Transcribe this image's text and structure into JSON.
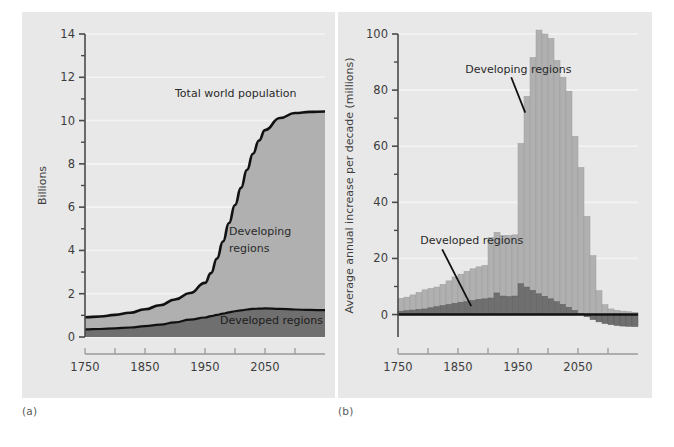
{
  "figure": {
    "background_color": "#ffffff",
    "panel_color": "#e8e8e8",
    "caption_a": "(a)",
    "caption_b": "(b)"
  },
  "colors": {
    "developed": "#6f6f6f",
    "developing": "#b0b0b0",
    "line": "#111111",
    "gridline": "#f4f4f4",
    "axis": "#4a4a4a",
    "text": "#3d3d3d"
  },
  "chart_data": [
    {
      "type": "area",
      "panel": "a",
      "title": "",
      "xlabel": "",
      "ylabel": "Billions",
      "xlim": [
        1750,
        2150
      ],
      "ylim": [
        0,
        14
      ],
      "grid": true,
      "xticks": [
        1750,
        1850,
        1950,
        2050
      ],
      "xtick_labels": [
        "1750",
        "1850",
        "1950",
        "2050"
      ],
      "xminor": [
        1800,
        1900,
        2000,
        2100
      ],
      "yticks": [
        0,
        2,
        4,
        6,
        8,
        10,
        12,
        14
      ],
      "ytick_labels": [
        "0",
        "2",
        "4",
        "6",
        "8",
        "10",
        "12",
        "14"
      ],
      "yminor": [
        1,
        3,
        5,
        7,
        9,
        11,
        13
      ],
      "annotations": [
        {
          "text": "Total world population",
          "x": 1900,
          "y": 11.1
        },
        {
          "text": "Developing",
          "x": 1990,
          "y": 4.7
        },
        {
          "text": "regions",
          "x": 1990,
          "y": 3.95
        },
        {
          "text": "Developed regions",
          "x": 1975,
          "y": 0.62
        }
      ],
      "x": [
        1750,
        1775,
        1800,
        1825,
        1850,
        1875,
        1900,
        1925,
        1950,
        1960,
        1970,
        1980,
        1990,
        2000,
        2010,
        2020,
        2030,
        2040,
        2050,
        2075,
        2100,
        2125,
        2150
      ],
      "series": [
        {
          "name": "Developed regions",
          "values": [
            0.35,
            0.37,
            0.4,
            0.44,
            0.5,
            0.57,
            0.68,
            0.8,
            0.9,
            0.96,
            1.02,
            1.08,
            1.14,
            1.19,
            1.23,
            1.27,
            1.3,
            1.31,
            1.32,
            1.3,
            1.27,
            1.25,
            1.24
          ]
        },
        {
          "name": "Developing regions",
          "values": [
            0.56,
            0.58,
            0.62,
            0.68,
            0.78,
            0.9,
            1.05,
            1.23,
            1.6,
            1.99,
            2.61,
            3.33,
            4.13,
            4.91,
            5.66,
            6.45,
            7.17,
            7.77,
            8.24,
            8.82,
            9.08,
            9.15,
            9.18
          ]
        }
      ],
      "total_label": "Total world population",
      "total": [
        0.91,
        0.95,
        1.02,
        1.12,
        1.28,
        1.47,
        1.73,
        2.03,
        2.5,
        2.95,
        3.63,
        4.41,
        5.27,
        6.1,
        6.89,
        7.72,
        8.47,
        9.08,
        9.56,
        10.12,
        10.35,
        10.4,
        10.42
      ]
    },
    {
      "type": "bar",
      "panel": "b",
      "subtype": "stacked",
      "title": "",
      "xlabel": "",
      "ylabel": "Average annual increase per decade (millions)",
      "xlim": [
        1750,
        2150
      ],
      "ylim": [
        -8,
        100
      ],
      "grid": true,
      "xticks": [
        1750,
        1850,
        1950,
        2050
      ],
      "xtick_labels": [
        "1750",
        "1850",
        "1950",
        "2050"
      ],
      "xminor": [
        1800,
        1900,
        2000,
        2100
      ],
      "yticks": [
        0,
        20,
        40,
        60,
        80,
        100
      ],
      "ytick_labels": [
        "0",
        "20",
        "40",
        "60",
        "80",
        "100"
      ],
      "yminor": [
        10,
        30,
        50,
        70,
        90
      ],
      "annotations": [
        {
          "text": "Developing regions",
          "x": 1862,
          "y": 86,
          "leader_to_x": 1962,
          "leader_to_y": 72
        },
        {
          "text": "Developed regions",
          "x": 1787,
          "y": 25,
          "leader_to_x": 1872,
          "leader_to_y": 3
        }
      ],
      "categories": [
        1750,
        1760,
        1770,
        1780,
        1790,
        1800,
        1810,
        1820,
        1830,
        1840,
        1850,
        1860,
        1870,
        1880,
        1890,
        1900,
        1910,
        1920,
        1930,
        1940,
        1950,
        1960,
        1970,
        1980,
        1990,
        2000,
        2010,
        2020,
        2030,
        2040,
        2050,
        2060,
        2070,
        2080,
        2090,
        2100,
        2110,
        2120,
        2130,
        2140
      ],
      "series": [
        {
          "name": "Developed regions",
          "values": [
            1.2,
            1.4,
            1.6,
            1.8,
            2.0,
            2.4,
            2.8,
            3.2,
            3.6,
            4.0,
            4.4,
            4.6,
            5.0,
            5.4,
            5.6,
            5.9,
            7.7,
            6.6,
            6.4,
            6.6,
            11.0,
            9.8,
            8.6,
            7.4,
            6.5,
            5.6,
            4.6,
            3.6,
            2.6,
            1.5,
            0.4,
            -0.8,
            -1.8,
            -2.6,
            -3.2,
            -3.6,
            -3.9,
            -4.1,
            -4.2,
            -4.3
          ]
        },
        {
          "name": "Developing regions",
          "values": [
            4.6,
            4.8,
            5.4,
            6.1,
            6.8,
            6.9,
            7.0,
            7.6,
            8.4,
            9.4,
            10.0,
            10.8,
            11.3,
            11.6,
            11.9,
            21.5,
            21.6,
            21.6,
            21.8,
            21.8,
            50.0,
            68.0,
            83.0,
            94.0,
            93.5,
            92.8,
            86.0,
            81.0,
            77.0,
            62.0,
            52.0,
            35.0,
            21.0,
            8.5,
            3.5,
            2.0,
            1.5,
            1.2,
            1.0,
            0.8
          ]
        }
      ]
    }
  ]
}
